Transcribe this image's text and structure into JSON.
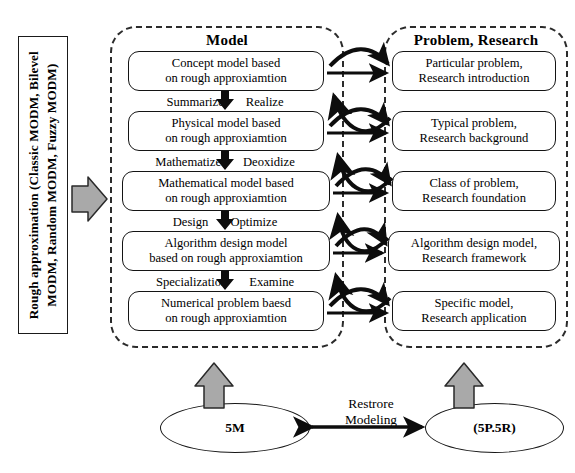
{
  "figure": {
    "type": "flow-diagram",
    "left_caption": {
      "line1": "Rough approximation (Classic MODM, Bilevel",
      "line2": "MODM, Random MODM, Fuzzy MODM)"
    },
    "groups": {
      "model_title": "Model",
      "problem_title": "Problem, Research"
    },
    "model_nodes": [
      {
        "line1": "Concept model based",
        "line2": "on rough approxiamtion"
      },
      {
        "line1": "Physical model based",
        "line2": "on rough approxiamtion"
      },
      {
        "line1": "Mathematical model based",
        "line2": "on rough approxiamtion"
      },
      {
        "line1": "Algorithm design model",
        "line2": "based on rough approxiamtion"
      },
      {
        "line1": "Numerical problem baesd",
        "line2": "on rough approxiamtion"
      }
    ],
    "problem_nodes": [
      {
        "line1": "Particular problem,",
        "line2": "Research introduction"
      },
      {
        "line1": "Typical problem,",
        "line2": "Research background"
      },
      {
        "line1": "Class of problem,",
        "line2": "Research foundation"
      },
      {
        "line1": "Algorithm design model,",
        "line2": "Research framework"
      },
      {
        "line1": "Specific model,",
        "line2": "Research application"
      }
    ],
    "transitions": [
      {
        "left": "Summarize",
        "right": "Realize"
      },
      {
        "left": "Mathematize",
        "right": "Deoxidize"
      },
      {
        "left": "Design",
        "right": "Optimize"
      },
      {
        "left": "Specialization",
        "right": "Examine"
      }
    ],
    "bottom": {
      "left_ellipse": "5M",
      "right_ellipse": "(5P.5R)",
      "link_line1": "Restrore",
      "link_line2": "Modeling"
    },
    "icons": {
      "gray_right_arrow": "gray-right-arrow-icon",
      "gray_up_arrow_left": "gray-up-arrow-icon",
      "gray_up_arrow_right": "gray-up-arrow-icon",
      "down_arrow": "down-arrow-icon",
      "double_arrow": "double-headed-arrow-icon"
    },
    "colors": {
      "gray_arrow_fill": "#a9a9a9",
      "stroke": "#141414",
      "background": "#ffffff"
    }
  }
}
